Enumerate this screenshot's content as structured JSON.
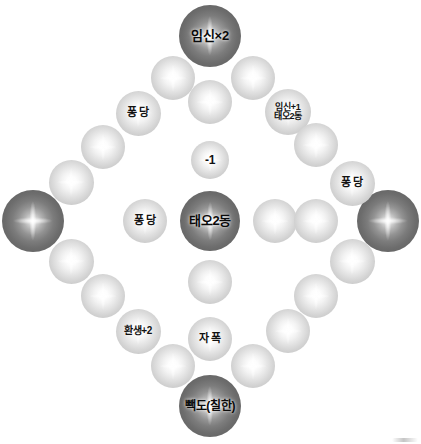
{
  "board": {
    "title": "윷놀이판",
    "width": 421,
    "height": 444,
    "background_color": "#ffffff",
    "light_node_color": "#dcdcdc",
    "dark_node_color": "#6d6d6d",
    "label_color": "#111111"
  },
  "nodes": [
    {
      "id": "top-corner",
      "label": "임신×2",
      "kind": "dark",
      "x": 210,
      "y": 36,
      "d": 62,
      "font": 13
    },
    {
      "id": "bottom-corner",
      "label": "빽도(칠한)",
      "kind": "dark",
      "x": 210,
      "y": 406,
      "d": 62,
      "font": 12
    },
    {
      "id": "left-corner",
      "label": "",
      "kind": "dark",
      "x": 33,
      "y": 221,
      "d": 62,
      "font": 12
    },
    {
      "id": "right-corner",
      "label": "",
      "kind": "dark",
      "x": 388,
      "y": 221,
      "d": 62,
      "font": 12
    },
    {
      "id": "center",
      "label": "태오2동",
      "kind": "dark",
      "x": 210,
      "y": 221,
      "d": 60,
      "font": 13
    },
    {
      "id": "ring-ne-1",
      "label": "",
      "kind": "light",
      "x": 253,
      "y": 78,
      "d": 44,
      "font": 11
    },
    {
      "id": "ring-ne-2",
      "label": "임신+1\n태오2동",
      "kind": "light",
      "x": 288,
      "y": 112,
      "d": 46,
      "font": 9
    },
    {
      "id": "ring-ne-3",
      "label": "",
      "kind": "light",
      "x": 316,
      "y": 145,
      "d": 44,
      "font": 11
    },
    {
      "id": "ring-ne-4",
      "label": "퐁 당",
      "kind": "light",
      "x": 352,
      "y": 183,
      "d": 45,
      "font": 11
    },
    {
      "id": "ring-nw-1",
      "label": "",
      "kind": "light",
      "x": 173,
      "y": 78,
      "d": 44,
      "font": 11
    },
    {
      "id": "ring-nw-2",
      "label": "퐁 당",
      "kind": "light",
      "x": 138,
      "y": 113,
      "d": 45,
      "font": 11
    },
    {
      "id": "ring-nw-3",
      "label": "",
      "kind": "light",
      "x": 103,
      "y": 147,
      "d": 44,
      "font": 11
    },
    {
      "id": "ring-nw-4",
      "label": "",
      "kind": "light",
      "x": 71,
      "y": 182,
      "d": 45,
      "font": 11
    },
    {
      "id": "ring-sw-1",
      "label": "",
      "kind": "light",
      "x": 71,
      "y": 261,
      "d": 45,
      "font": 11
    },
    {
      "id": "ring-sw-2",
      "label": "",
      "kind": "light",
      "x": 103,
      "y": 296,
      "d": 44,
      "font": 11
    },
    {
      "id": "ring-sw-3",
      "label": "환생+2",
      "kind": "light",
      "x": 138,
      "y": 331,
      "d": 45,
      "font": 10
    },
    {
      "id": "ring-sw-4",
      "label": "",
      "kind": "light",
      "x": 173,
      "y": 366,
      "d": 44,
      "font": 11
    },
    {
      "id": "ring-se-1",
      "label": "",
      "kind": "light",
      "x": 352,
      "y": 261,
      "d": 45,
      "font": 11
    },
    {
      "id": "ring-se-2",
      "label": "",
      "kind": "light",
      "x": 316,
      "y": 296,
      "d": 44,
      "font": 11
    },
    {
      "id": "ring-se-3",
      "label": "",
      "kind": "light",
      "x": 288,
      "y": 331,
      "d": 44,
      "font": 11
    },
    {
      "id": "ring-se-4",
      "label": "",
      "kind": "light",
      "x": 253,
      "y": 366,
      "d": 44,
      "font": 11
    },
    {
      "id": "diag-nw-in-1",
      "label": "",
      "kind": "light",
      "x": 210,
      "y": 102,
      "d": 44,
      "font": 11
    },
    {
      "id": "diag-nw-in-2",
      "label": "-1",
      "kind": "light",
      "x": 210,
      "y": 160,
      "d": 38,
      "font": 12
    },
    {
      "id": "diag-sw-in-1",
      "label": "퐁 당",
      "kind": "light",
      "x": 145,
      "y": 221,
      "d": 44,
      "font": 11
    },
    {
      "id": "diag-se-in-1",
      "label": "",
      "kind": "light",
      "x": 275,
      "y": 221,
      "d": 44,
      "font": 11
    },
    {
      "id": "diag-se-in-2",
      "label": "",
      "kind": "light",
      "x": 316,
      "y": 221,
      "d": 44,
      "font": 11
    },
    {
      "id": "diag-s-in-1",
      "label": "",
      "kind": "light",
      "x": 210,
      "y": 282,
      "d": 44,
      "font": 11
    },
    {
      "id": "diag-s-in-2",
      "label": "자 폭",
      "kind": "light",
      "x": 210,
      "y": 339,
      "d": 44,
      "font": 11
    }
  ]
}
